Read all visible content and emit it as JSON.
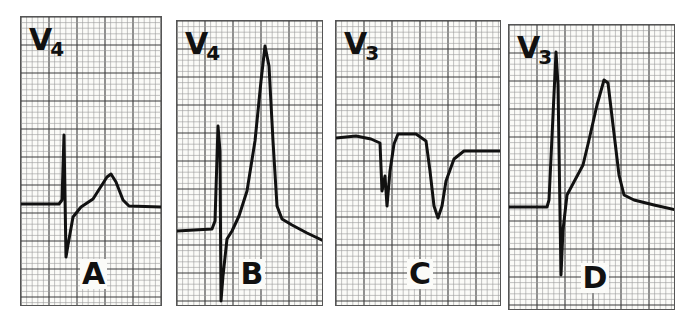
{
  "figure": {
    "panels": [
      {
        "id": "A",
        "lead": "V",
        "lead_sub": "4",
        "label": "A",
        "box": {
          "x": 20,
          "y": 16,
          "w": 142,
          "h": 290
        },
        "baseline_y": 187,
        "trace": "M0,187 L38,187 L41,183 L43,118 L45,240 L47,228 L52,200 L60,190 L72,182 L86,160 L90,157 L95,165 L102,183 L108,189 L142,190"
      },
      {
        "id": "B",
        "lead": "V",
        "lead_sub": "4",
        "label": "B",
        "box": {
          "x": 176,
          "y": 20,
          "w": 147,
          "h": 286
        },
        "baseline_y": 229,
        "trace": "M0,210 L35,208 L38,200 L41,105 L43,130 L44,280 L46,255 L50,218 L55,210 L62,195 L70,170 L78,120 L84,60 L88,25 L92,45 L96,120 L100,185 L105,198 L115,204 L130,212 L147,220"
      },
      {
        "id": "C",
        "lead": "V",
        "lead_sub": "3",
        "label": "C",
        "box": {
          "x": 335,
          "y": 20,
          "w": 166,
          "h": 286
        },
        "baseline_y": 135,
        "trace": "M0,117 L20,115 L35,118 L44,122 L46,170 L49,155 L51,185 L54,150 L58,123 L62,113 L80,113 L90,120 L94,150 L98,185 L102,197 L106,185 L110,160 L118,138 L128,130 L166,130"
      },
      {
        "id": "D",
        "lead": "V",
        "lead_sub": "3",
        "label": "D",
        "box": {
          "x": 508,
          "y": 24,
          "w": 167,
          "h": 286
        },
        "baseline_y": 205,
        "trace": "M0,182 L38,182 L40,175 L47,27 L49,60 L52,250 L54,205 L58,170 L66,155 L74,140 L80,115 L88,80 L95,55 L99,58 L104,100 L110,150 L115,170 L125,175 L145,180 L167,185"
      }
    ]
  },
  "colors": {
    "paper": "#fbfbf8",
    "grid_minor": "#9a9a9a",
    "grid_major": "#3a3a3a",
    "trace": "#111111"
  }
}
